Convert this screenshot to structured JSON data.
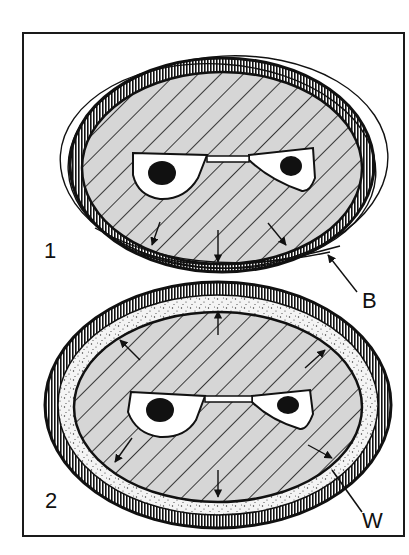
{
  "figure": {
    "panels": [
      {
        "number_label": "1",
        "description": "Cross-section with loose outer band wrapping the ring",
        "callout": {
          "label": "B"
        }
      },
      {
        "number_label": "2",
        "description": "Cross-section with stippled layer between core and outer ring",
        "callout": {
          "label": "W"
        }
      }
    ]
  },
  "colors": {
    "ink": "#111111",
    "core_fill": "#d6d6d6",
    "background": "#ffffff",
    "stipple_fill": "#f2f2f2"
  }
}
